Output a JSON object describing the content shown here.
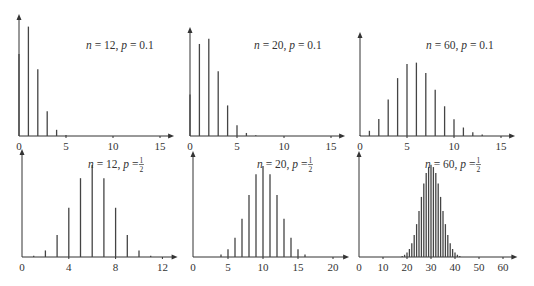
{
  "figure": {
    "colors": {
      "axis": "#333333",
      "bar": "#444444",
      "text": "#333333"
    }
  },
  "chart_data": [
    {
      "type": "bar",
      "title": "n = 12, p = 0.1",
      "label": {
        "n": "12",
        "p": "0.1"
      },
      "n": 12,
      "p": 0.1,
      "categories": [
        0,
        1,
        2,
        3,
        4,
        5,
        6,
        7,
        8,
        9,
        10,
        11,
        12
      ],
      "values": [
        0.2824,
        0.3766,
        0.2301,
        0.0852,
        0.0213,
        0.0038,
        0.0005,
        0.0,
        0.0,
        0.0,
        0.0,
        0.0,
        0.0
      ],
      "xticks": [
        "0",
        "5",
        "10",
        "15"
      ],
      "xtick_values": [
        0,
        5,
        10,
        15
      ],
      "xlim": [
        0,
        16.5
      ],
      "ylim": [
        0,
        0.42
      ],
      "xlabel": "",
      "ylabel": "",
      "grid": false
    },
    {
      "type": "bar",
      "title": "n = 20, p = 0.1",
      "label": {
        "n": "20",
        "p": "0.1"
      },
      "n": 20,
      "p": 0.1,
      "categories": [
        0,
        1,
        2,
        3,
        4,
        5,
        6,
        7,
        8
      ],
      "values": [
        0.1216,
        0.2702,
        0.2852,
        0.1901,
        0.0898,
        0.0319,
        0.0089,
        0.002,
        0.0004
      ],
      "xticks": [
        "0",
        "5",
        "10",
        "15"
      ],
      "xtick_values": [
        0,
        5,
        10,
        15
      ],
      "xlim": [
        0,
        16.5
      ],
      "ylim": [
        0,
        0.32
      ],
      "xlabel": "",
      "ylabel": "",
      "grid": false
    },
    {
      "type": "bar",
      "title": "n = 60, p = 0.1",
      "label": {
        "n": "60",
        "p": "0.1"
      },
      "n": 60,
      "p": 0.1,
      "categories": [
        0,
        1,
        2,
        3,
        4,
        5,
        6,
        7,
        8,
        9,
        10,
        11,
        12,
        13,
        14,
        15
      ],
      "values": [
        0.0018,
        0.012,
        0.0393,
        0.0844,
        0.1336,
        0.1662,
        0.1693,
        0.1451,
        0.1068,
        0.0686,
        0.0389,
        0.0196,
        0.0089,
        0.0036,
        0.0013,
        0.0004
      ],
      "xticks": [
        "0",
        "5",
        "10",
        "15"
      ],
      "xtick_values": [
        0,
        5,
        10,
        15
      ],
      "xlim": [
        0,
        16.5
      ],
      "ylim": [
        0,
        0.24
      ],
      "xlabel": "",
      "ylabel": "",
      "grid": false
    },
    {
      "type": "bar",
      "title": "n = 12, p = 1/2",
      "label": {
        "n": "12",
        "p_num": "1",
        "p_den": "2"
      },
      "n": 12,
      "p": 0.5,
      "categories": [
        0,
        1,
        2,
        3,
        4,
        5,
        6,
        7,
        8,
        9,
        10,
        11,
        12
      ],
      "values": [
        0.0002,
        0.0029,
        0.0161,
        0.0537,
        0.1208,
        0.1934,
        0.2256,
        0.1934,
        0.1208,
        0.0537,
        0.0161,
        0.0029,
        0.0002
      ],
      "xticks": [
        "0",
        "4",
        "8",
        "12"
      ],
      "xtick_values": [
        0,
        4,
        8,
        12
      ],
      "xlim": [
        0,
        13.3
      ],
      "ylim": [
        0,
        0.265
      ],
      "xlabel": "",
      "ylabel": "",
      "grid": false
    },
    {
      "type": "bar",
      "title": "n = 20, p = 1/2",
      "label": {
        "n": "20",
        "p_num": "1",
        "p_den": "2"
      },
      "n": 20,
      "p": 0.5,
      "categories": [
        3,
        4,
        5,
        6,
        7,
        8,
        9,
        10,
        11,
        12,
        13,
        14,
        15,
        16,
        17
      ],
      "values": [
        0.0011,
        0.0046,
        0.0148,
        0.037,
        0.0739,
        0.1201,
        0.1602,
        0.1762,
        0.1602,
        0.1201,
        0.0739,
        0.037,
        0.0148,
        0.0046,
        0.0011
      ],
      "xticks": [
        "0",
        "5",
        "10",
        "15",
        "20"
      ],
      "xtick_values": [
        0,
        5,
        10,
        15,
        20
      ],
      "xlim": [
        0,
        22.3
      ],
      "ylim": [
        0,
        0.205
      ],
      "xlabel": "",
      "ylabel": "",
      "grid": false
    },
    {
      "type": "bar",
      "title": "n = 60, p = 1/2",
      "label": {
        "n": "60",
        "p_num": "1",
        "p_den": "2"
      },
      "n": 60,
      "p": 0.5,
      "categories": [
        18,
        19,
        20,
        21,
        22,
        23,
        24,
        25,
        26,
        27,
        28,
        29,
        30,
        31,
        32,
        33,
        34,
        35,
        36,
        37,
        38,
        39,
        40,
        41,
        42
      ],
      "values": [
        0.0011,
        0.0025,
        0.0049,
        0.0089,
        0.0152,
        0.0244,
        0.0366,
        0.0512,
        0.0669,
        0.0818,
        0.0935,
        0.1001,
        0.1026,
        0.1001,
        0.0935,
        0.0818,
        0.0669,
        0.0512,
        0.0366,
        0.0244,
        0.0152,
        0.0089,
        0.0049,
        0.0025,
        0.0011
      ],
      "xticks": [
        "0",
        "10",
        "20",
        "30",
        "40",
        "50",
        "60"
      ],
      "xtick_values": [
        0,
        10,
        20,
        30,
        40,
        50,
        60
      ],
      "xlim": [
        0,
        66
      ],
      "ylim": [
        0,
        0.118
      ],
      "xlabel": "",
      "ylabel": "",
      "grid": false
    }
  ]
}
